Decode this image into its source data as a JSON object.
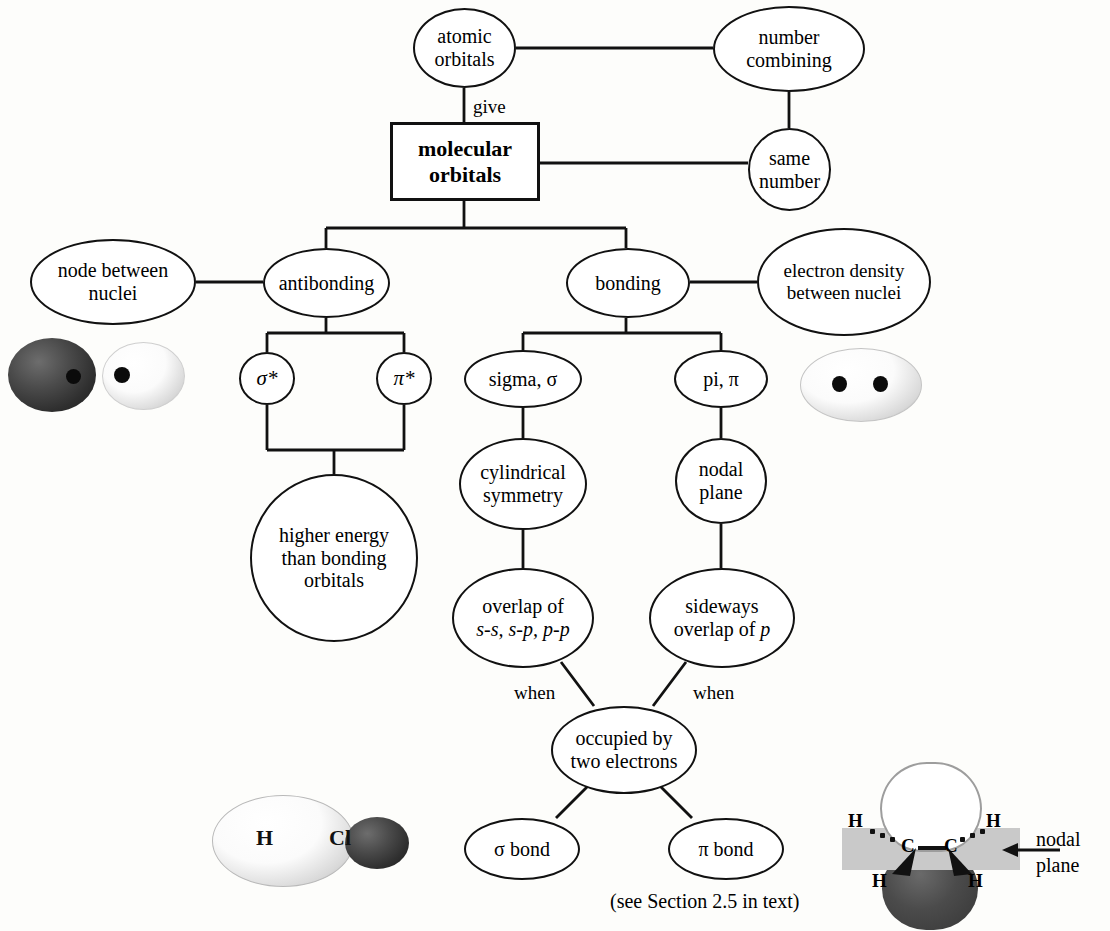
{
  "diagram": {
    "footnote": "(see Section 2.5 in text)",
    "nodes": {
      "atomic_orbitals": "atomic\norbitals",
      "number_combining": "number\ncombining",
      "molecular_orbitals": "molecular\norbitals",
      "same_number": "same\nnumber",
      "node_between_nuclei": "node between\nnuclei",
      "antibonding": "antibonding",
      "bonding": "bonding",
      "electron_density": "electron density\nbetween nuclei",
      "sigma_star": "σ*",
      "pi_star": "π*",
      "sigma": "sigma, σ",
      "pi": "pi, π",
      "higher_energy": "higher energy\nthan bonding\norbitals",
      "cylindrical_symmetry": "cylindrical\nsymmetry",
      "nodal_plane": "nodal\nplane",
      "overlap_of": "overlap of\ns-s, s-p, p-p",
      "overlap_line1": "overlap of",
      "overlap_line2": "s-s, s-p, p-p",
      "sideways_overlap": "sideways\noverlap of p",
      "sideways_line1": "sideways",
      "sideways_line2a": "overlap of ",
      "sideways_line2b": "p",
      "occupied": "occupied by\ntwo electrons",
      "sigma_bond": "σ bond",
      "pi_bond": "π bond"
    },
    "edge_labels": {
      "give": "give",
      "when_left": "when",
      "when_right": "when"
    },
    "illustrations": {
      "antibonding_orbital": {
        "caption": "antibonding orbital: two separated lobes with node between nuclei"
      },
      "bonding_orbital": {
        "caption": "bonding orbital: merged lobe with electron density between nuclei"
      },
      "hcl_sigma": {
        "caption": "HCl sigma bonding orbital",
        "labels": [
          "H",
          "Cl"
        ]
      },
      "ethylene_pi": {
        "caption": "ethylene pi bond with nodal plane",
        "atoms": [
          "H",
          "H",
          "C",
          "C",
          "H",
          "H"
        ],
        "annotation": "nodal\nplane",
        "annotation_line1": "nodal",
        "annotation_line2": "plane"
      }
    },
    "colors": {
      "stroke": "#111111",
      "background": "#fdfdfb",
      "nodal_plane_gray": "#c9c9c9",
      "dark_lobe": "#2f2f2f",
      "light_lobe": "#ffffff"
    }
  }
}
